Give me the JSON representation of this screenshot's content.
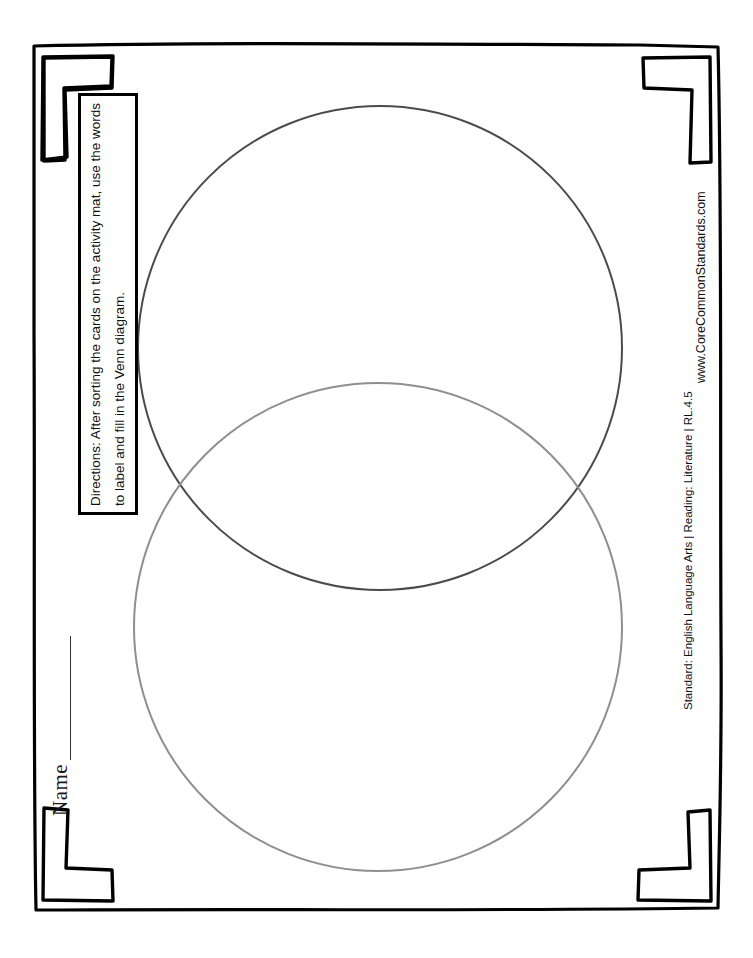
{
  "page": {
    "background_color": "#ffffff",
    "width": 753,
    "height": 958
  },
  "name_field": {
    "label": "Name",
    "value": ""
  },
  "directions": {
    "text": "Directions: After sorting the cards on the activity mat, use the words to label and fill in the Venn diagram."
  },
  "footer": {
    "standard": "Standard: English Language Arts  |  Reading: Literature  |  RL.4.5",
    "url": "www.CoreCommonStandards.com"
  },
  "venn": {
    "top_circle": {
      "label": "",
      "cx": 380,
      "cy": 348,
      "r": 242,
      "stroke_color": "#4b4b4b",
      "stroke_width": 2
    },
    "bottom_circle": {
      "label": "",
      "cx": 378,
      "cy": 627,
      "r": 244,
      "stroke_color": "#8f8f8f",
      "stroke_width": 2
    },
    "overlap_label": ""
  },
  "frame": {
    "border_color": "#000000",
    "corner_count": 4
  }
}
